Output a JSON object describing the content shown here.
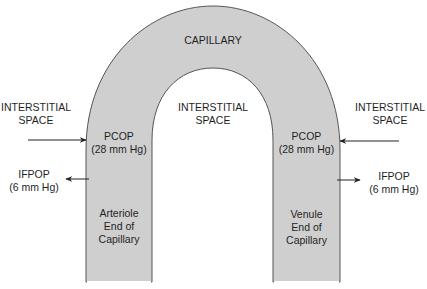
{
  "diagram": {
    "title": "CAPILLARY",
    "colors": {
      "capillary_fill": "#cfcfcf",
      "capillary_stroke": "#555555",
      "arrow": "#222222",
      "background": "#ffffff"
    },
    "interstitial_left": {
      "line1": "INTERSTITIAL",
      "line2": "SPACE"
    },
    "interstitial_center": {
      "line1": "INTERSTITIAL",
      "line2": "SPACE"
    },
    "interstitial_right": {
      "line1": "INTERSTITIAL",
      "line2": "SPACE"
    },
    "arteriole_end": {
      "pcop": {
        "line1": "PCOP",
        "line2": "(28 mm Hg)",
        "arrow_direction": "inward"
      },
      "ifpop": {
        "line1": "IFPOP",
        "line2": "(6 mm Hg)",
        "arrow_direction": "outward"
      },
      "label": {
        "line1": "Arteriole",
        "line2": "End of",
        "line3": "Capillary"
      }
    },
    "venule_end": {
      "pcop": {
        "line1": "PCOP",
        "line2": "(28 mm Hg)",
        "arrow_direction": "inward"
      },
      "ifpop": {
        "line1": "IFPOP",
        "line2": "(6 mm Hg)",
        "arrow_direction": "outward"
      },
      "label": {
        "line1": "Venule",
        "line2": "End of",
        "line3": "Capillary"
      }
    }
  }
}
